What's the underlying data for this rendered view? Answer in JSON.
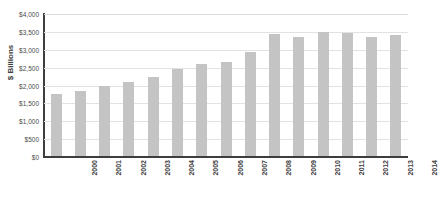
{
  "chart_data": {
    "type": "bar",
    "title": "",
    "xlabel": "",
    "ylabel": "$ Billions",
    "ylim": [
      0,
      4000
    ],
    "grid": true,
    "legend": "none",
    "orientation": "vertical",
    "bar_color": "#c4c4c4",
    "axis_color": "#3d3d3d",
    "gridline_color": "#e2e2e2",
    "categories": [
      "2000",
      "2001",
      "2002",
      "2003",
      "2004",
      "2005",
      "2006",
      "2007",
      "2008",
      "2009",
      "2010",
      "2011",
      "2012",
      "2013",
      "2014"
    ],
    "values": [
      1760,
      1840,
      1990,
      2110,
      2240,
      2465,
      2600,
      2660,
      2945,
      3440,
      3370,
      3510,
      3470,
      3350,
      3415
    ],
    "y_ticks": [
      0,
      500,
      1000,
      1500,
      2000,
      2500,
      3000,
      3500,
      4000
    ],
    "y_tick_labels": [
      "$0",
      "$500",
      "$1,000",
      "$1,500",
      "$2,000",
      "$2,500",
      "$3,000",
      "$3,500",
      "$4,000"
    ],
    "x_tick_labels": [
      "2000",
      "2001",
      "2002",
      "2003",
      "2004",
      "2005",
      "2006",
      "2007",
      "2008",
      "2009",
      "2010",
      "2011",
      "2012",
      "2013",
      "2014"
    ]
  },
  "figure": {
    "title_remnant": ""
  }
}
